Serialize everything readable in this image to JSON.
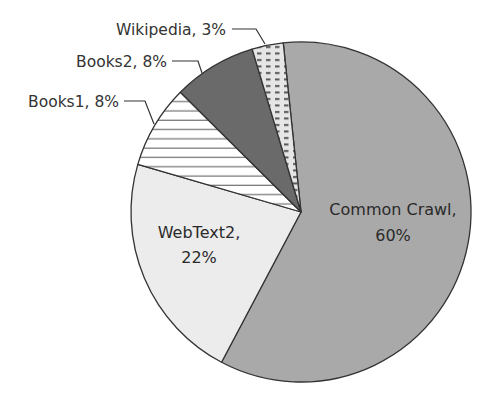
{
  "chart_data": {
    "type": "pie",
    "title": "",
    "categories": [
      "Common Crawl",
      "WebText2",
      "Books1",
      "Books2",
      "Wikipedia"
    ],
    "values": [
      60,
      22,
      8,
      8,
      3
    ],
    "unit": "%",
    "labels": [
      "Common Crawl, 60%",
      "WebText2, 22%",
      "Books1, 8%",
      "Books2, 8%",
      "Wikipedia, 3%"
    ],
    "legend": "none (direct labels with callout lines)",
    "start_angle_deg": -6,
    "direction": "clockwise"
  },
  "slices": [
    {
      "name": "Common Crawl",
      "value": 60,
      "fill": "#a9a9a9",
      "pattern": "solid",
      "label_lines": [
        "Common Crawl,",
        "60%"
      ]
    },
    {
      "name": "WebText2",
      "value": 22,
      "fill": "#ececec",
      "pattern": "solid",
      "label_lines": [
        "WebText2,",
        "22%"
      ]
    },
    {
      "name": "Books1",
      "value": 8,
      "fill": "#ffffff",
      "pattern": "horizontal-lines",
      "label": "Books1, 8%"
    },
    {
      "name": "Books2",
      "value": 8,
      "fill": "#6a6a6a",
      "pattern": "solid",
      "label": "Books2, 8%"
    },
    {
      "name": "Wikipedia",
      "value": 3,
      "fill": "#e6e6e6",
      "pattern": "dashes",
      "label": "Wikipedia, 3%"
    }
  ],
  "colors": {
    "outline": "#333333",
    "text": "#333333"
  }
}
